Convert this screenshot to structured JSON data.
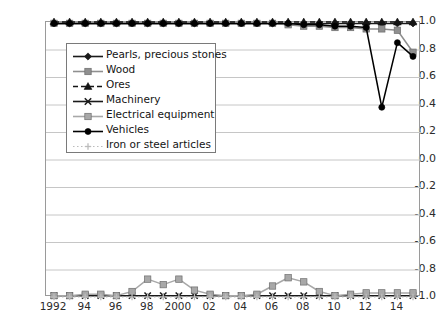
{
  "chart_data": {
    "type": "line",
    "title": "",
    "xlabel": "",
    "ylabel": "",
    "ylim": [
      -1.0,
      1.0
    ],
    "xlim": [
      1992,
      2015
    ],
    "grid": true,
    "legend_position": "upper-left-inside",
    "y_ticks": [
      "1.0",
      "0.8",
      "0.6",
      "0.4",
      "0.2",
      "0.0",
      "-0.2",
      "-0.4",
      "-0.6",
      "-0.8",
      "-1.0"
    ],
    "y_tick_values": [
      1.0,
      0.8,
      0.6,
      0.4,
      0.2,
      0.0,
      -0.2,
      -0.4,
      -0.6,
      -0.8,
      -1.0
    ],
    "x": [
      1992,
      1993,
      1994,
      1995,
      1996,
      1997,
      1998,
      1999,
      2000,
      2001,
      2002,
      2003,
      2004,
      2005,
      2006,
      2007,
      2008,
      2009,
      2010,
      2011,
      2012,
      2013,
      2014,
      2015
    ],
    "x_tick_labels": [
      "1992",
      "94",
      "96",
      "98",
      "2000",
      "02",
      "04",
      "06",
      "08",
      "10",
      "12",
      "14"
    ],
    "x_tick_values": [
      1992,
      1994,
      1996,
      1998,
      2000,
      2002,
      2004,
      2006,
      2008,
      2010,
      2012,
      2014
    ],
    "series": [
      {
        "name": "Pearls, precious stones",
        "color": "#1a1a1a",
        "marker": "diamond",
        "dash": "solid",
        "values": [
          0.99,
          0.99,
          0.99,
          0.99,
          0.99,
          0.99,
          0.99,
          0.99,
          0.99,
          0.99,
          0.99,
          0.99,
          0.99,
          0.99,
          0.99,
          0.99,
          0.99,
          0.99,
          0.99,
          0.99,
          0.99,
          0.99,
          0.99,
          0.99
        ]
      },
      {
        "name": "Wood",
        "color": "#8f8f8f",
        "marker": "square",
        "dash": "solid",
        "values": [
          0.99,
          0.99,
          0.99,
          0.99,
          0.99,
          0.99,
          0.99,
          0.99,
          0.99,
          0.99,
          0.99,
          0.99,
          0.99,
          0.99,
          0.99,
          0.98,
          0.97,
          0.97,
          0.96,
          0.96,
          0.95,
          0.95,
          0.94,
          0.78
        ]
      },
      {
        "name": "Ores",
        "color": "#141414",
        "marker": "triangle",
        "dash": "dashed",
        "values": [
          1.0,
          1.0,
          1.0,
          1.0,
          1.0,
          1.0,
          1.0,
          1.0,
          1.0,
          1.0,
          1.0,
          1.0,
          1.0,
          1.0,
          1.0,
          1.0,
          1.0,
          1.0,
          1.0,
          1.0,
          1.0,
          1.0,
          1.0,
          1.0
        ]
      },
      {
        "name": "Machinery",
        "color": "#1a1a1a",
        "marker": "x",
        "dash": "solid",
        "values": [
          -0.99,
          -0.99,
          -0.99,
          -0.99,
          -0.99,
          -0.99,
          -0.99,
          -0.99,
          -0.99,
          -0.99,
          -0.99,
          -0.99,
          -0.99,
          -0.99,
          -0.99,
          -0.99,
          -0.99,
          -0.99,
          -0.99,
          -0.99,
          -0.99,
          -0.99,
          -0.99,
          -0.99
        ]
      },
      {
        "name": "Electrical equipment",
        "color": "#a8a8a8",
        "marker": "square",
        "dash": "solid",
        "values": [
          -0.99,
          -0.99,
          -0.98,
          -0.98,
          -0.99,
          -0.96,
          -0.87,
          -0.91,
          -0.87,
          -0.95,
          -0.98,
          -0.99,
          -0.99,
          -0.98,
          -0.92,
          -0.86,
          -0.89,
          -0.96,
          -0.99,
          -0.98,
          -0.97,
          -0.97,
          -0.97,
          -0.97
        ]
      },
      {
        "name": "Vehicles",
        "color": "#000000",
        "marker": "circle",
        "dash": "solid",
        "values": [
          0.99,
          0.99,
          0.99,
          0.99,
          0.99,
          0.99,
          0.99,
          0.99,
          0.99,
          0.99,
          0.99,
          0.99,
          0.99,
          0.99,
          0.99,
          0.99,
          0.98,
          0.98,
          0.97,
          0.97,
          0.96,
          0.38,
          0.85,
          0.75
        ]
      },
      {
        "name": "Iron or steel articles",
        "color": "#bcbcbc",
        "marker": "plus",
        "dash": "dotted",
        "values": [
          -1.0,
          -1.0,
          -1.0,
          -1.0,
          -1.0,
          -1.0,
          -1.0,
          -1.0,
          -1.0,
          -1.0,
          -1.0,
          -1.0,
          -1.0,
          -1.0,
          -1.0,
          -1.0,
          -1.0,
          -1.0,
          -1.0,
          -1.0,
          -1.0,
          -1.0,
          -1.0,
          -1.0
        ]
      }
    ]
  },
  "legend": {
    "items": [
      {
        "label": "Pearls, precious stones"
      },
      {
        "label": "Wood"
      },
      {
        "label": "Ores"
      },
      {
        "label": "Machinery"
      },
      {
        "label": "Electrical equipment"
      },
      {
        "label": "Vehicles"
      },
      {
        "label": "Iron or steel articles"
      }
    ]
  }
}
